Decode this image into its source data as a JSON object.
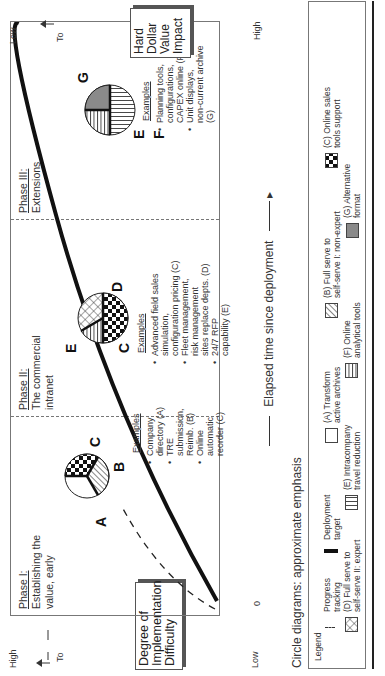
{
  "diagram": {
    "y_axis": {
      "title": "Degree of Implementation Difficulty",
      "title_lines": [
        "Degree of",
        "Implementation",
        "Difficulty"
      ],
      "high_label": "High",
      "low_label": "Low",
      "to_label": "To"
    },
    "right_axis": {
      "title": "Hard Dollar Value Impact",
      "title_lines": [
        "Hard",
        "Dollar",
        "Value",
        "Impact"
      ],
      "low_label": "Low",
      "high_label": "High",
      "to_label": "To"
    },
    "x_axis": {
      "title": "Elapsed time since deployment",
      "origin_label": "0"
    },
    "phases": [
      {
        "title": "Phase I:",
        "subtitle_lines": [
          "Establishing the",
          "value, early"
        ],
        "examples_header": "Examples",
        "examples": [
          [
            "Company",
            "directory (A)"
          ],
          [
            "TRE submission,",
            "Reimb. (B)"
          ],
          [
            "Online automatic",
            "reorder (C)"
          ]
        ],
        "pie_letters": [
          "A",
          "B",
          "C"
        ]
      },
      {
        "title": "Phase II:",
        "subtitle_lines": [
          "The commercial",
          "intranet"
        ],
        "examples_header": "Examples",
        "examples": [
          [
            "Advanced field sales",
            "simulation,",
            "configuration pricing (C)"
          ],
          [
            "Fleet management,",
            "risk management",
            "sites replace depts. (D)"
          ],
          [
            "24/7 RFP",
            "capability (E)"
          ]
        ],
        "pie_letters": [
          "C",
          "E",
          "D"
        ]
      },
      {
        "title": "Phase III:",
        "subtitle_lines": [
          "Extensions"
        ],
        "examples_header": "Examples",
        "examples": [
          [
            "Planning tools,",
            "configurations,",
            "CAPEX online (F)"
          ],
          [
            "Unit displays,",
            "non-current archive",
            "(G)"
          ]
        ],
        "pie_letters": [
          "E",
          "G",
          "F"
        ]
      }
    ],
    "caption": "Circle diagrams: approximate emphasis",
    "legend": {
      "header": "Legend",
      "items": [
        {
          "key": "progress",
          "lines": [
            "Progress",
            "tracking"
          ],
          "pattern": "dashed-line"
        },
        {
          "key": "deployment",
          "lines": [
            "Deployment",
            "target"
          ],
          "pattern": "solid-thick-line"
        },
        {
          "key": "A",
          "lines": [
            "(A) Transform",
            "active archives"
          ],
          "pattern": "blank"
        },
        {
          "key": "B",
          "lines": [
            "(B) Full serve to",
            "self-serve I: non-expert"
          ],
          "pattern": "diagonal-hatch"
        },
        {
          "key": "C",
          "lines": [
            "(C) Online sales",
            "tools support"
          ],
          "pattern": "checkerboard"
        },
        {
          "key": "D",
          "lines": [
            "(D) Full serve to",
            "self-serve II: expert"
          ],
          "pattern": "crosshatch"
        },
        {
          "key": "E",
          "lines": [
            "(E) Intracompany",
            "travel reduction"
          ],
          "pattern": "vertical-lines"
        },
        {
          "key": "F",
          "lines": [
            "(F) Online",
            "analytical tools"
          ],
          "pattern": "horizontal-lines"
        },
        {
          "key": "G",
          "lines": [
            "(G) Alternative",
            "format"
          ],
          "pattern": "gray-fill"
        }
      ]
    },
    "colors": {
      "line": "#111111",
      "gray_fill": "#8a8a8a",
      "frame": "#777777"
    }
  }
}
